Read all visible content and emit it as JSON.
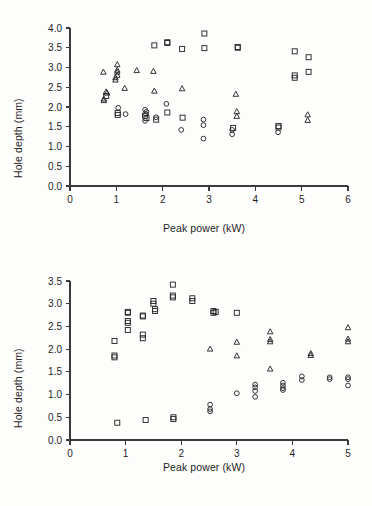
{
  "figure": {
    "name": "hole-depth-vs-peak-power",
    "panel_count": 2
  },
  "panels": {
    "top": {
      "xlabel": "Peak power (kW)",
      "ylabel": "Hole depth (mm)",
      "xticks": [
        "0",
        "1",
        "2",
        "3",
        "4",
        "5",
        "6"
      ],
      "yticks": [
        "0.0",
        "0.5",
        "1.0",
        "1.5",
        "2.0",
        "2.5",
        "3.0",
        "3.5",
        "4.0"
      ]
    },
    "bottom": {
      "xlabel": "Peak power (kW)",
      "ylabel": "Hole depth (mm)",
      "xticks": [
        "0",
        "1",
        "2",
        "3",
        "4",
        "5"
      ],
      "yticks": [
        "0.0",
        "0.5",
        "1.0",
        "1.5",
        "2.0",
        "2.5",
        "3.0",
        "3.5"
      ]
    }
  },
  "chart_data": [
    {
      "type": "scatter",
      "panel": "top",
      "title": "",
      "xlabel": "Peak power (kW)",
      "ylabel": "Hole depth (mm)",
      "xlim": [
        0,
        6
      ],
      "ylim": [
        0,
        4.0
      ],
      "xticks": [
        0,
        1,
        2,
        3,
        4,
        5,
        6
      ],
      "yticks": [
        0.0,
        0.5,
        1.0,
        1.5,
        2.0,
        2.5,
        3.0,
        3.5,
        4.0
      ],
      "grid": false,
      "legend": "none",
      "series": [
        {
          "name": "square-series",
          "marker": "square",
          "points": [
            [
              1.03,
              1.85
            ],
            [
              1.03,
              1.8
            ],
            [
              1.62,
              1.78
            ],
            [
              1.65,
              1.72
            ],
            [
              1.82,
              3.56
            ],
            [
              1.86,
              1.68
            ],
            [
              2.1,
              3.64
            ],
            [
              2.1,
              3.62
            ],
            [
              2.1,
              1.86
            ],
            [
              2.42,
              3.47
            ],
            [
              2.43,
              1.73
            ],
            [
              2.9,
              3.86
            ],
            [
              2.9,
              3.49
            ],
            [
              3.52,
              1.47
            ],
            [
              3.62,
              3.52
            ],
            [
              3.62,
              3.5
            ],
            [
              4.5,
              1.52
            ],
            [
              4.5,
              1.48
            ],
            [
              4.85,
              3.41
            ],
            [
              4.85,
              2.8
            ],
            [
              4.85,
              2.74
            ],
            [
              5.15,
              3.26
            ],
            [
              5.15,
              2.89
            ],
            [
              0.78,
              2.28
            ]
          ]
        },
        {
          "name": "triangle-series",
          "marker": "triangle",
          "points": [
            [
              0.72,
              2.88
            ],
            [
              0.78,
              2.38
            ],
            [
              0.8,
              2.35
            ],
            [
              0.73,
              2.2
            ],
            [
              0.73,
              2.16
            ],
            [
              0.98,
              2.74
            ],
            [
              0.98,
              2.68
            ],
            [
              1.02,
              3.07
            ],
            [
              1.02,
              2.93
            ],
            [
              1.02,
              2.88
            ],
            [
              1.02,
              2.8
            ],
            [
              1.18,
              2.47
            ],
            [
              1.44,
              2.92
            ],
            [
              1.8,
              2.9
            ],
            [
              1.82,
              2.4
            ],
            [
              2.42,
              2.46
            ],
            [
              3.58,
              2.32
            ],
            [
              3.6,
              1.88
            ],
            [
              3.6,
              1.76
            ],
            [
              5.13,
              1.8
            ],
            [
              5.13,
              1.66
            ]
          ]
        },
        {
          "name": "circle-series",
          "marker": "circle",
          "points": [
            [
              1.04,
              1.98
            ],
            [
              1.2,
              1.82
            ],
            [
              1.62,
              1.93
            ],
            [
              1.65,
              1.88
            ],
            [
              1.64,
              1.82
            ],
            [
              1.62,
              1.65
            ],
            [
              1.86,
              1.74
            ],
            [
              2.08,
              2.08
            ],
            [
              2.4,
              1.42
            ],
            [
              2.88,
              1.68
            ],
            [
              2.88,
              1.54
            ],
            [
              2.88,
              1.2
            ],
            [
              3.5,
              1.42
            ],
            [
              3.5,
              1.31
            ],
            [
              4.49,
              1.36
            ]
          ]
        }
      ]
    },
    {
      "type": "scatter",
      "panel": "bottom",
      "title": "",
      "xlabel": "Peak power (kW)",
      "ylabel": "Hole depth (mm)",
      "xlim": [
        0,
        5
      ],
      "ylim": [
        0,
        3.5
      ],
      "xticks": [
        0,
        1,
        2,
        3,
        4,
        5
      ],
      "yticks": [
        0.0,
        0.5,
        1.0,
        1.5,
        2.0,
        2.5,
        3.0,
        3.5
      ],
      "grid": false,
      "legend": "none",
      "series": [
        {
          "name": "square-series",
          "marker": "square",
          "points": [
            [
              0.8,
              2.18
            ],
            [
              0.8,
              1.86
            ],
            [
              0.8,
              1.82
            ],
            [
              1.04,
              2.82
            ],
            [
              1.04,
              2.8
            ],
            [
              1.04,
              2.62
            ],
            [
              1.04,
              2.58
            ],
            [
              1.04,
              2.42
            ],
            [
              1.31,
              2.74
            ],
            [
              1.31,
              2.72
            ],
            [
              1.31,
              2.32
            ],
            [
              1.31,
              2.24
            ],
            [
              1.5,
              3.06
            ],
            [
              1.5,
              3.0
            ],
            [
              1.53,
              2.88
            ],
            [
              1.53,
              2.84
            ],
            [
              1.85,
              3.42
            ],
            [
              1.85,
              3.18
            ],
            [
              1.85,
              3.14
            ],
            [
              2.2,
              3.12
            ],
            [
              2.2,
              3.06
            ],
            [
              2.58,
              2.84
            ],
            [
              2.58,
              2.8
            ],
            [
              2.62,
              2.82
            ],
            [
              3.0,
              2.8
            ],
            [
              0.85,
              0.38
            ],
            [
              1.36,
              0.44
            ],
            [
              1.86,
              0.5
            ],
            [
              1.86,
              0.46
            ]
          ]
        },
        {
          "name": "triangle-series",
          "marker": "triangle",
          "points": [
            [
              2.52,
              2.0
            ],
            [
              3.0,
              2.15
            ],
            [
              3.0,
              1.85
            ],
            [
              3.6,
              2.38
            ],
            [
              3.6,
              2.21
            ],
            [
              3.6,
              2.16
            ],
            [
              3.6,
              1.56
            ],
            [
              4.33,
              1.9
            ],
            [
              4.33,
              1.86
            ],
            [
              5.0,
              2.47
            ],
            [
              5.0,
              2.22
            ],
            [
              5.0,
              2.16
            ]
          ]
        },
        {
          "name": "circle-series",
          "marker": "circle",
          "points": [
            [
              2.52,
              0.78
            ],
            [
              2.52,
              0.68
            ],
            [
              2.52,
              0.63
            ],
            [
              3.0,
              1.03
            ],
            [
              3.33,
              1.22
            ],
            [
              3.33,
              1.16
            ],
            [
              3.33,
              1.08
            ],
            [
              3.33,
              0.95
            ],
            [
              3.83,
              1.26
            ],
            [
              3.83,
              1.2
            ],
            [
              3.83,
              1.14
            ],
            [
              3.83,
              1.1
            ],
            [
              4.17,
              1.4
            ],
            [
              4.17,
              1.32
            ],
            [
              4.67,
              1.38
            ],
            [
              4.67,
              1.34
            ],
            [
              5.0,
              1.38
            ],
            [
              5.0,
              1.34
            ],
            [
              5.0,
              1.2
            ]
          ]
        }
      ]
    }
  ]
}
